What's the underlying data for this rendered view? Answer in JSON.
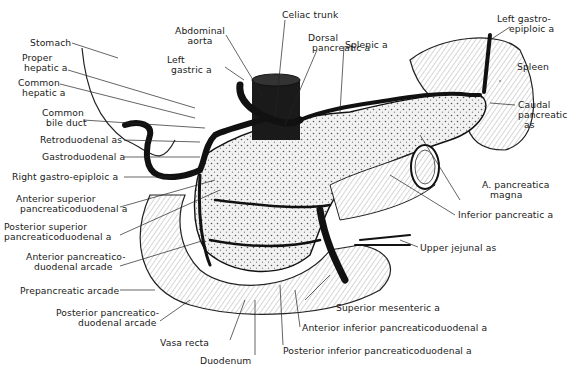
{
  "figure": {
    "style": "black-and-white anatomical line illustration",
    "colors": {
      "ink": "#111111",
      "background": "#ffffff",
      "parenchyma": "#e6e6e6"
    }
  },
  "labels": {
    "stomach": "Stomach",
    "proper_hepatic": [
      "Proper",
      "hepatic a"
    ],
    "common_hepatic": [
      "Common",
      "hepatic a"
    ],
    "common_bile_duct": [
      "Common",
      "bile duct"
    ],
    "retroduodenal": "Retroduodenal as",
    "gastroduodenal": "Gastroduodenal a",
    "right_gastro_epiploic": "Right gastro-epiploic a",
    "anterior_superior_pd": [
      "Anterior superior",
      "pancreaticoduodenal a"
    ],
    "posterior_superior_pd": [
      "Posterior superior",
      "pancreaticoduodenal a"
    ],
    "anterior_pd_arcade": [
      "Anterior pancreatico-",
      "duodenal arcade"
    ],
    "prepancreatic_arcade": "Prepancreatic arcade",
    "posterior_pd_arcade": [
      "Posterior pancreatico-",
      "duodenal arcade"
    ],
    "vasa_recta": "Vasa recta",
    "duodenum": "Duodenum",
    "abdominal_aorta": [
      "Abdominal",
      "aorta"
    ],
    "left_gastric": [
      "Left",
      "gastric a"
    ],
    "celiac_trunk": "Celiac trunk",
    "dorsal_pancreatic": [
      "Dorsal",
      "pancreatic a"
    ],
    "splenic": "Splenic a",
    "left_gastro_epiploic": [
      "Left gastro-",
      "epiploic a"
    ],
    "spleen": "Spleen",
    "caudal_pancreatic": [
      "Caudal",
      "pancreatic",
      "as"
    ],
    "a_pancreatica_magna": [
      "A. pancreatica",
      "magna"
    ],
    "inferior_pancreatic": "Inferior pancreatic a",
    "upper_jejunal": "Upper jejunal as",
    "superior_mesenteric": "Superior mesenteric a",
    "anterior_inferior_pd": "Anterior inferior pancreaticoduodenal a",
    "posterior_inferior_pd": "Posterior inferior pancreaticoduodenal a"
  }
}
